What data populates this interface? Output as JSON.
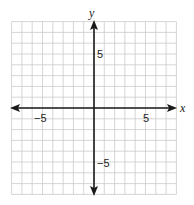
{
  "chart_data": {
    "type": "coordinate-grid",
    "title": "",
    "xlabel": "x",
    "ylabel": "y",
    "xlim": [
      -8,
      8
    ],
    "ylim": [
      -8,
      8
    ],
    "grid": true,
    "grid_step": 1,
    "x_tick_labels": [
      {
        "value": -5,
        "label": "−5"
      },
      {
        "value": 5,
        "label": "5"
      }
    ],
    "y_tick_labels": [
      {
        "value": 5,
        "label": "5"
      },
      {
        "value": -5,
        "label": "−5"
      }
    ],
    "arrows": "both axes, both directions",
    "points": []
  },
  "labels": {
    "x_axis": "x",
    "y_axis": "y",
    "x_neg5": "−5",
    "x_pos5": "5",
    "y_pos5": "5",
    "y_neg5": "−5"
  },
  "colors": {
    "grid": "#cccccc",
    "axis": "#1a1a1a",
    "text": "#222222"
  }
}
